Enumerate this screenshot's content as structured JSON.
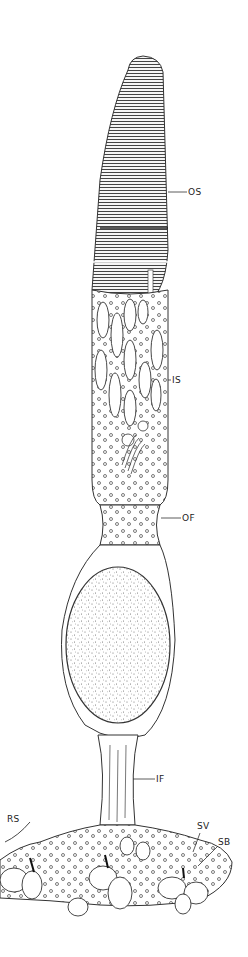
{
  "figure": {
    "labels": [
      {
        "id": "os",
        "text": "OS",
        "x": 188,
        "y": 188
      },
      {
        "id": "is",
        "text": "IS",
        "x": 172,
        "y": 376
      },
      {
        "id": "of",
        "text": "OF",
        "x": 182,
        "y": 514
      },
      {
        "id": "if",
        "text": "IF",
        "x": 156,
        "y": 775
      },
      {
        "id": "rs",
        "text": "RS",
        "x": 7,
        "y": 815
      },
      {
        "id": "sv",
        "text": "SV",
        "x": 197,
        "y": 822
      },
      {
        "id": "sb",
        "text": "SB",
        "x": 218,
        "y": 838
      }
    ],
    "colors": {
      "line": "#333333",
      "background": "#ffffff"
    }
  }
}
